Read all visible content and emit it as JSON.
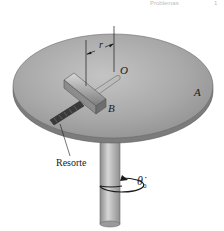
{
  "header": {
    "partial_text_left": "Problemas",
    "partial_text_right": "1"
  },
  "figure": {
    "labels": {
      "disk": "A",
      "center": "O",
      "slider": "B",
      "distance": "r",
      "spring": "Resorte",
      "angular_velocity": "θ̇",
      "angular_velocity_subscript": "0"
    },
    "colors": {
      "disk_top": "#a9a9a9",
      "disk_edge": "#7a7a7a",
      "shaft": "#b8b8b8",
      "ink": "#1a1a1a"
    }
  }
}
